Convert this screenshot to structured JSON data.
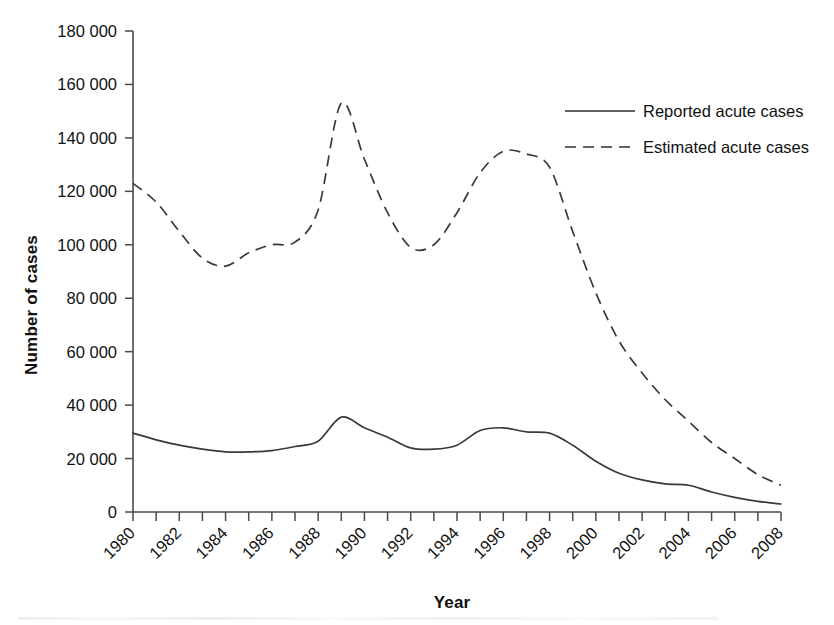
{
  "chart_data": {
    "type": "line",
    "title": "",
    "xlabel": "Year",
    "ylabel": "Number of cases",
    "xlim": [
      1980,
      2008
    ],
    "ylim": [
      0,
      180000
    ],
    "grid": false,
    "legend_position": "top-right",
    "y_ticks": [
      0,
      20000,
      40000,
      60000,
      80000,
      100000,
      120000,
      140000,
      160000,
      180000
    ],
    "y_tick_labels": [
      "0",
      "20 000",
      "40 000",
      "60 000",
      "80 000",
      "100 000",
      "120 000",
      "140 000",
      "160 000",
      "180 000"
    ],
    "x_ticks": [
      1980,
      1981,
      1982,
      1983,
      1984,
      1985,
      1986,
      1987,
      1988,
      1989,
      1990,
      1991,
      1992,
      1993,
      1994,
      1995,
      1996,
      1997,
      1998,
      1999,
      2000,
      2001,
      2002,
      2003,
      2004,
      2005,
      2006,
      2007,
      2008
    ],
    "x_tick_labels": [
      "1980",
      "1982",
      "1984",
      "1986",
      "1988",
      "1990",
      "1992",
      "1994",
      "1996",
      "1998",
      "2000",
      "2002",
      "2004",
      "2006",
      "2008"
    ],
    "x_tick_label_years": [
      1980,
      1982,
      1984,
      1986,
      1988,
      1990,
      1992,
      1994,
      1996,
      1998,
      2000,
      2002,
      2004,
      2006,
      2008
    ],
    "x": [
      1980,
      1981,
      1982,
      1983,
      1984,
      1985,
      1986,
      1987,
      1988,
      1989,
      1990,
      1991,
      1992,
      1993,
      1994,
      1995,
      1996,
      1997,
      1998,
      1999,
      2000,
      2001,
      2002,
      2003,
      2004,
      2005,
      2006,
      2007,
      2008
    ],
    "series": [
      {
        "name": "Reported acute cases",
        "style": "solid",
        "color": "#3a3a3a",
        "values": [
          29500,
          27000,
          25000,
          23500,
          22500,
          22500,
          23000,
          24500,
          26500,
          35500,
          31500,
          28000,
          24000,
          23500,
          25000,
          30500,
          31500,
          30000,
          29500,
          25000,
          19000,
          14500,
          12000,
          10500,
          10000,
          7500,
          5500,
          4000,
          3000
        ]
      },
      {
        "name": "Estimated acute cases",
        "style": "dashed",
        "color": "#3a3a3a",
        "values": [
          123000,
          116000,
          105000,
          95000,
          92000,
          97000,
          100000,
          101000,
          113000,
          153000,
          132000,
          112000,
          99000,
          100000,
          112000,
          127000,
          135000,
          134000,
          129000,
          105000,
          82000,
          64000,
          52000,
          42000,
          34000,
          26000,
          20000,
          14000,
          10000
        ]
      }
    ],
    "legend": [
      {
        "label": "Reported acute cases",
        "style": "solid"
      },
      {
        "label": "Estimated acute cases",
        "style": "dashed"
      }
    ]
  }
}
